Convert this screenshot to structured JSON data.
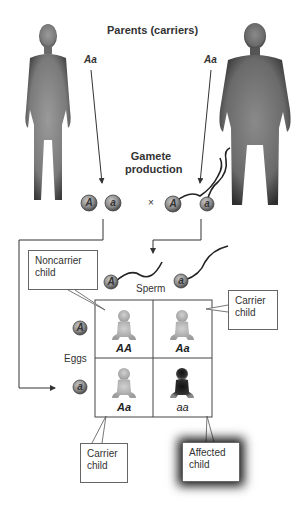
{
  "header": {
    "title": "Parents (carriers)"
  },
  "parents": {
    "mother": {
      "genotype": "Aa"
    },
    "father": {
      "genotype": "Aa"
    }
  },
  "gamete_production": {
    "line1": "Gamete",
    "line2": "production"
  },
  "gametes": {
    "eggs": [
      "A",
      "a"
    ],
    "cross_symbol": "×",
    "sperm": [
      "A",
      "a"
    ]
  },
  "labels": {
    "sperm": "Sperm",
    "eggs": "Eggs"
  },
  "punnett": {
    "rows": [
      "A",
      "a"
    ],
    "cols": [
      "A",
      "a"
    ],
    "cells": [
      [
        {
          "genotype": "AA",
          "phenotype": "noncarrier"
        },
        {
          "genotype": "Aa",
          "phenotype": "carrier"
        }
      ],
      [
        {
          "genotype": "Aa",
          "phenotype": "carrier"
        },
        {
          "genotype": "aa",
          "phenotype": "affected"
        }
      ]
    ]
  },
  "callouts": {
    "noncarrier": {
      "line1": "Noncarrier",
      "line2": "child"
    },
    "carrier_top": {
      "line1": "Carrier",
      "line2": "child"
    },
    "carrier_bottom": {
      "line1": "Carrier",
      "line2": "child"
    },
    "affected": {
      "line1": "Affected",
      "line2": "child"
    }
  },
  "colors": {
    "body": "#8a8a8a",
    "body_edge": "#3a3a3a",
    "gamete_fill": "#9a9a9a",
    "baby_light": "#b5b5b5",
    "baby_dark": "#1e1e1e"
  }
}
